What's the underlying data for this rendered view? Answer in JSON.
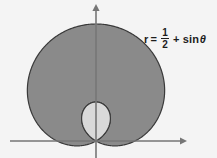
{
  "figure": {
    "background_color": "#f4f4f4"
  },
  "equation": {
    "variable": "r",
    "equals": "=",
    "fraction_numerator": "1",
    "fraction_denominator": "2",
    "plus": "+",
    "function": "sin",
    "angle": "θ",
    "plain_text": "r = 1/2 + sinθ",
    "color": "#1d1d1d"
  },
  "axes": {
    "x_axis_label": "",
    "y_axis_label": "",
    "axis_color": "#767676",
    "origin_x": 96,
    "origin_y": 141,
    "x_axis_start": 10,
    "x_axis_end": 186,
    "y_axis_top": 5,
    "y_axis_bottom": 158,
    "x_arrow": "arrow-right",
    "y_arrow": "arrow-up"
  },
  "chart_data": {
    "type": "line",
    "plot_kind": "polar",
    "title": "",
    "xlabel": "",
    "ylabel": "",
    "equation": "r = 1/2 + sin(theta)",
    "curve_name": "limacon with inner loop",
    "a": 0.5,
    "b": 1.0,
    "theta_range_deg": [
      0,
      360
    ],
    "r_max": 1.5,
    "r_min": -0.5,
    "outer_loop_fill": "#8a8a8a",
    "inner_loop_fill": "#d9d9d9",
    "stroke_color": "#3a3a3a",
    "grid": false,
    "legend": "none",
    "key_points": [
      {
        "theta_deg": 0,
        "r": 0.5
      },
      {
        "theta_deg": 30,
        "r": 1.0
      },
      {
        "theta_deg": 90,
        "r": 1.5
      },
      {
        "theta_deg": 150,
        "r": 1.0
      },
      {
        "theta_deg": 180,
        "r": 0.5
      },
      {
        "theta_deg": 210,
        "r": 0.0
      },
      {
        "theta_deg": 270,
        "r": -0.5
      },
      {
        "theta_deg": 330,
        "r": 0.0
      }
    ],
    "annotations": [
      {
        "text": "r = 1/2 + sinθ",
        "x": 144,
        "y": 28
      }
    ]
  }
}
